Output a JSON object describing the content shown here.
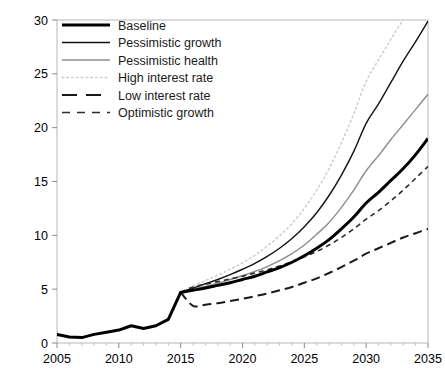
{
  "chart_data": {
    "type": "line",
    "title": "",
    "subtitle": "",
    "xlabel": "",
    "ylabel": "",
    "xlim": [
      2005,
      2035
    ],
    "ylim": [
      0,
      30
    ],
    "xticks": [
      2005,
      2010,
      2015,
      2020,
      2025,
      2030,
      2035
    ],
    "yticks": [
      0,
      5,
      10,
      15,
      20,
      25,
      30
    ],
    "grid": false,
    "legend_position": "top-left",
    "x_history": [
      2005,
      2006,
      2007,
      2008,
      2009,
      2010,
      2011,
      2012,
      2013,
      2014,
      2015
    ],
    "history_values": [
      0.8,
      0.55,
      0.5,
      0.8,
      1.0,
      1.2,
      1.6,
      1.35,
      1.6,
      2.2,
      4.7
    ],
    "x_projection": [
      2015,
      2016,
      2017,
      2018,
      2019,
      2020,
      2021,
      2022,
      2023,
      2024,
      2025,
      2026,
      2027,
      2028,
      2029,
      2030,
      2031,
      2032,
      2033,
      2034,
      2035
    ],
    "series": [
      {
        "name": "Baseline",
        "style": "solid",
        "width": 3.0,
        "color": "#000000",
        "values": [
          4.7,
          4.9,
          5.1,
          5.35,
          5.6,
          5.9,
          6.2,
          6.6,
          7.0,
          7.5,
          8.1,
          8.8,
          9.6,
          10.6,
          11.7,
          13.0,
          14.0,
          15.1,
          16.2,
          17.5,
          19.0
        ]
      },
      {
        "name": "Pessimistic growth",
        "style": "solid",
        "width": 1.4,
        "color": "#121212",
        "values": [
          4.7,
          5.1,
          5.5,
          5.9,
          6.35,
          6.85,
          7.4,
          8.05,
          8.8,
          9.7,
          10.8,
          12.1,
          13.7,
          15.6,
          17.8,
          20.4,
          22.2,
          24.2,
          26.2,
          28.0,
          29.9
        ]
      },
      {
        "name": "Pessimistic health",
        "style": "solid",
        "width": 1.4,
        "color": "#8c8c8c",
        "values": [
          4.7,
          5.0,
          5.25,
          5.55,
          5.9,
          6.25,
          6.65,
          7.1,
          7.65,
          8.3,
          9.1,
          10.1,
          11.2,
          12.6,
          14.2,
          16.0,
          17.4,
          18.9,
          20.3,
          21.7,
          23.1
        ]
      },
      {
        "name": "High interest rate",
        "style": "dotted",
        "width": 1.6,
        "color": "#cfcfcf",
        "values": [
          4.7,
          5.3,
          5.8,
          6.3,
          6.85,
          7.45,
          8.15,
          9.0,
          9.95,
          11.1,
          12.5,
          14.2,
          16.2,
          18.6,
          21.3,
          24.3,
          26.3,
          28.2,
          30.0,
          31.0,
          31.5
        ]
      },
      {
        "name": "Low interest rate",
        "style": "long-dash",
        "width": 2.0,
        "color": "#1a1a1a",
        "values": [
          4.7,
          3.45,
          3.55,
          3.7,
          3.9,
          4.1,
          4.35,
          4.6,
          4.9,
          5.2,
          5.6,
          6.0,
          6.5,
          7.05,
          7.65,
          8.3,
          8.8,
          9.3,
          9.8,
          10.2,
          10.6
        ]
      },
      {
        "name": "Optimistic growth",
        "style": "short-dash",
        "width": 1.6,
        "color": "#2b2b2b",
        "values": [
          4.7,
          5.2,
          5.45,
          5.7,
          5.95,
          6.2,
          6.5,
          6.8,
          7.15,
          7.55,
          8.0,
          8.5,
          9.1,
          9.8,
          10.6,
          11.5,
          12.3,
          13.2,
          14.2,
          15.3,
          16.4
        ]
      }
    ]
  },
  "axis": {
    "x_tick_labels": [
      "2005",
      "2010",
      "2015",
      "2020",
      "2025",
      "2030",
      "2035"
    ],
    "y_tick_labels": [
      "0",
      "5",
      "10",
      "15",
      "20",
      "25",
      "30"
    ]
  },
  "legend": {
    "items": [
      {
        "label": "Baseline",
        "swatch": "baseline-swatch"
      },
      {
        "label": "Pessimistic growth",
        "swatch": "pessimistic-growth-swatch"
      },
      {
        "label": "Pessimistic health",
        "swatch": "pessimistic-health-swatch"
      },
      {
        "label": "High interest rate",
        "swatch": "high-interest-rate-swatch"
      },
      {
        "label": "Low interest rate",
        "swatch": "low-interest-rate-swatch"
      },
      {
        "label": "Optimistic growth",
        "swatch": "optimistic-growth-swatch"
      }
    ]
  },
  "colors": {
    "baseline": "#000000",
    "pessimistic_growth": "#121212",
    "pessimistic_health": "#8c8c8c",
    "high_interest_rate": "#cfcfcf",
    "low_interest_rate": "#1a1a1a",
    "optimistic_growth": "#2b2b2b",
    "frame": "#b8b8b8",
    "text": "#000000"
  }
}
